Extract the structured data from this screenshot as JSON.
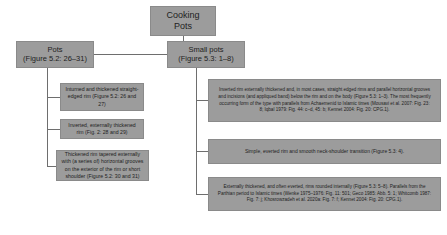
{
  "diagram": {
    "type": "hierarchy-flowchart",
    "colors": {
      "node_fill": "#9c9c9c",
      "node_border": "#8a8a8a",
      "connector": "#6e6e6e",
      "background": "#ffffff",
      "text": "#222222"
    },
    "nodes": {
      "root": {
        "label": "Cooking\nPots"
      },
      "pots": {
        "label": "Pots\n(Figure 5.2: 26–31)"
      },
      "small_pots": {
        "label": "Small pots\n(Figure 5.3: 1–8)"
      },
      "pots_children": [
        {
          "label": "Inturned and thickened straight-edged rim (Figure 5.2: 26 and 27)"
        },
        {
          "label": "Inverted, externally thickened rim (Fig. 2: 28 and 29)"
        },
        {
          "label": "Thickened rim tapered externally with (a series of) horizontal grooves on the exterior of the rim or short shoulder (Figure 5.2: 30 and 31)"
        }
      ],
      "small_pots_children": [
        {
          "label": "Inverted rim externally thickened and, in most cases, straight edged rims and parallel horizontal grooves and incisions (and appliqued band) below the rim and on the body (Figure 5.3: 1–3). The most frequently occurring form of the type with parallels from Achaemenid to Islamic times (Mousavi et al. 2007: Fig. 23: 8; Iqbal 1979: Fig. 44: c–d, 45: b; Kennet 2004: Fig. 20: CPG.1)."
        },
        {
          "label": "Simple, everted rim and smooth neck-shoulder transition (Figure 5.3: 4)."
        },
        {
          "label": "Externally thickened, and often everted, rims rounded internally (Figure 5.3: 5–8). Parallels from the Parthian period to Islamic times (Wenke 1975–1976: Fig. 11: 501; Geco 1985: Abb. 5: 1; Whitcomb 1987: Fig. 7: j; Khosrowzadeh et al. 2020a: Fig. 7: f; Kennet 2004: Fig. 20: CPG.1)."
        }
      ]
    },
    "connectors": [
      {
        "from": "root",
        "to": "pots"
      },
      {
        "from": "root",
        "to": "small_pots"
      },
      {
        "from": "pots",
        "to": "pots_children.0"
      },
      {
        "from": "pots",
        "to": "pots_children.1"
      },
      {
        "from": "pots",
        "to": "pots_children.2"
      },
      {
        "from": "small_pots",
        "to": "small_pots_children.0"
      },
      {
        "from": "small_pots",
        "to": "small_pots_children.1"
      },
      {
        "from": "small_pots",
        "to": "small_pots_children.2"
      }
    ]
  }
}
